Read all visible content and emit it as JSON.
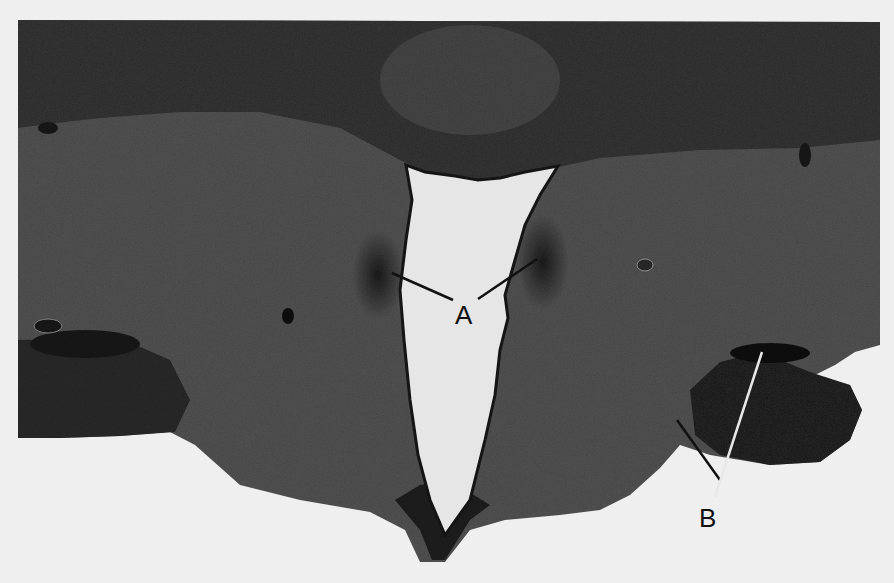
{
  "figure": {
    "type": "histology-micrograph",
    "colors": {
      "background": "#efefef",
      "tissue_dark": "#2a2a2a",
      "tissue_mid": "#4a4a4a",
      "tissue_light": "#5e5e5e",
      "ventricle": "#e6e6e6",
      "leader_line_light": "#e0e0e0",
      "leader_line_dark": "#111111"
    },
    "labels": [
      {
        "id": "A",
        "text": "A",
        "x": 466,
        "y": 324
      },
      {
        "id": "B",
        "text": "B",
        "x": 709,
        "y": 526
      }
    ]
  }
}
